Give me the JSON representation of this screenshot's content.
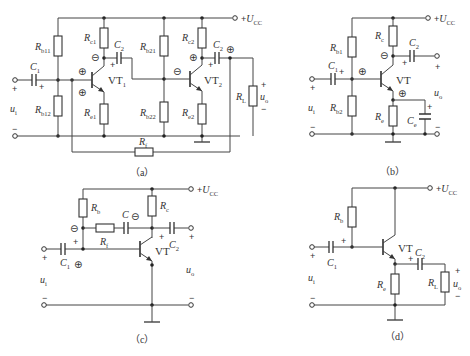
{
  "figure": {
    "supply_label": "+U",
    "supply_sub": "CC",
    "plus": "+",
    "minus": "−",
    "circle_plus": "⊕",
    "circle_minus": "⊖"
  },
  "circuits": {
    "a": {
      "caption": "（a）",
      "components": {
        "Rb11": {
          "main": "R",
          "sub": "b11"
        },
        "Rb12": {
          "main": "R",
          "sub": "b12"
        },
        "Rc1": {
          "main": "R",
          "sub": "c1"
        },
        "Re1": {
          "main": "R",
          "sub": "e1"
        },
        "C1": {
          "main": "C",
          "sub": "1"
        },
        "C2a": {
          "main": "C",
          "sub": "2"
        },
        "VT1": {
          "main": "VT",
          "sub": "1"
        },
        "Rb21": {
          "main": "R",
          "sub": "b21"
        },
        "Rb22": {
          "main": "R",
          "sub": "b22"
        },
        "Rc2": {
          "main": "R",
          "sub": "c2"
        },
        "Re2": {
          "main": "R",
          "sub": "e2"
        },
        "C2b": {
          "main": "C",
          "sub": "2"
        },
        "VT2": {
          "main": "VT",
          "sub": "2"
        },
        "RL": {
          "main": "R",
          "sub": "L"
        },
        "Rf": {
          "main": "R",
          "sub": "f"
        },
        "ui": {
          "main": "u",
          "sub": "i"
        },
        "uo": {
          "main": "u",
          "sub": "o"
        }
      }
    },
    "b": {
      "caption": "（b）",
      "components": {
        "Rb1": {
          "main": "R",
          "sub": "b1"
        },
        "Rb2": {
          "main": "R",
          "sub": "b2"
        },
        "Rc": {
          "main": "R",
          "sub": "c"
        },
        "Re": {
          "main": "R",
          "sub": "e"
        },
        "C1": {
          "main": "C",
          "sub": "1"
        },
        "C2": {
          "main": "C",
          "sub": "2"
        },
        "Ce": {
          "main": "C",
          "sub": "e"
        },
        "VT": {
          "main": "VT",
          "sub": ""
        },
        "ui": {
          "main": "u",
          "sub": "i"
        },
        "uo": {
          "main": "u",
          "sub": "o"
        }
      }
    },
    "c": {
      "caption": "（c）",
      "components": {
        "Rb": {
          "main": "R",
          "sub": "b"
        },
        "Rc": {
          "main": "R",
          "sub": "c"
        },
        "Rf": {
          "main": "R",
          "sub": "f"
        },
        "C": {
          "main": "C",
          "sub": ""
        },
        "C1": {
          "main": "C",
          "sub": "1"
        },
        "C2": {
          "main": "C",
          "sub": "2"
        },
        "VT": {
          "main": "VT",
          "sub": ""
        },
        "ui": {
          "main": "u",
          "sub": "i"
        },
        "uo": {
          "main": "u",
          "sub": "o"
        }
      }
    },
    "d": {
      "caption": "（d）",
      "components": {
        "Rb": {
          "main": "R",
          "sub": "b"
        },
        "Re": {
          "main": "R",
          "sub": "e"
        },
        "RL": {
          "main": "R",
          "sub": "L"
        },
        "C1": {
          "main": "C",
          "sub": "1"
        },
        "C2": {
          "main": "C",
          "sub": "2"
        },
        "VT": {
          "main": "VT",
          "sub": ""
        },
        "ui": {
          "main": "u",
          "sub": "i"
        },
        "uo": {
          "main": "u",
          "sub": "o"
        }
      }
    }
  }
}
